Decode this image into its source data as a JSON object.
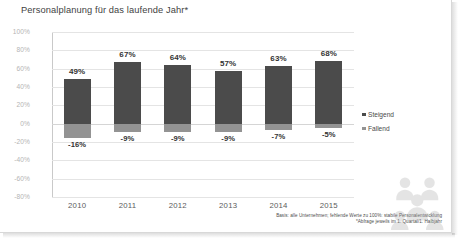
{
  "slide": {
    "title": "Personalplanung für das laufende Jahr*"
  },
  "footnote": {
    "line1": "Basis: alle Unternehmen; fehlende Werte zu 100%: stabile Personalentwicklung",
    "line2": "*Abfrage jeweils im 1. Quartal/1. Halbjahr"
  },
  "watermark": {
    "name": "people-group-icon"
  },
  "colors": {
    "steigend": "#4b4b4b",
    "fallend": "#939393",
    "grid": "#e4e4e4",
    "axis": "#c9c9c9"
  },
  "chart_data": {
    "type": "bar",
    "title": "Personalplanung für das laufende Jahr*",
    "xlabel": "",
    "ylabel": "",
    "ylim": [
      -80,
      100
    ],
    "ytick_labels": [
      "100%",
      "80%",
      "60%",
      "40%",
      "20%",
      "0%",
      "-20%",
      "-40%",
      "-60%",
      "-80%"
    ],
    "yticks": [
      100,
      80,
      60,
      40,
      20,
      0,
      -20,
      -40,
      -60,
      -80
    ],
    "grid": true,
    "legend_position": "right",
    "categories": [
      "2010",
      "2011",
      "2012",
      "2013",
      "2014",
      "2015"
    ],
    "series": [
      {
        "name": "Steigend",
        "color": "#4b4b4b",
        "values": [
          49,
          67,
          64,
          57,
          63,
          68
        ],
        "labels": [
          "49%",
          "67%",
          "64%",
          "57%",
          "63%",
          "68%"
        ]
      },
      {
        "name": "Fallend",
        "color": "#939393",
        "values": [
          -16,
          -9,
          -9,
          -9,
          -7,
          -5
        ],
        "labels": [
          "-16%",
          "-9%",
          "-9%",
          "-9%",
          "-7%",
          "-5%"
        ]
      }
    ]
  }
}
